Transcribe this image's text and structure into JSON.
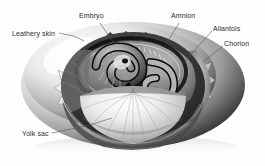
{
  "figure": {
    "style": "grayscale airbrush scientific illustration",
    "background_color": "#ffffff",
    "label_text_color": "#2b2b2b",
    "leader_line_color": "#555555",
    "shell_highlight_color": "#fafafa",
    "shell_midtone_color": "#c9c9c9",
    "shell_shadow_color": "#1d1d1d",
    "cavity_color": "#2f2f2f",
    "yolk_light_color": "#ededed",
    "membrane_color": "#9a9a9a"
  },
  "labels": [
    {
      "id": "leathery-skin",
      "text": "Leathery skin"
    },
    {
      "id": "embryo",
      "text": "Embryo"
    },
    {
      "id": "amnion",
      "text": "Amnion"
    },
    {
      "id": "allantois",
      "text": "Allantois"
    },
    {
      "id": "chorion",
      "text": "Chorion"
    },
    {
      "id": "yolk-sac",
      "text": "Yolk sac"
    }
  ]
}
